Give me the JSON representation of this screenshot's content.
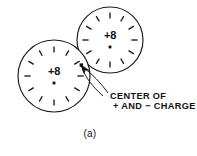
{
  "figure": {
    "caption": "(a)",
    "background_color": "#ffffff",
    "ink_color": "#111111",
    "width": 197,
    "height": 156
  },
  "callout": {
    "line1": "CENTER OF",
    "line2": "+ AND − CHARGE",
    "arrow_target_x": 82,
    "arrow_target_y": 66
  },
  "atoms": [
    {
      "id": "upper-right-atom",
      "nucleus_label": "+8",
      "center_x": 110,
      "center_y": 40,
      "radius": 33,
      "electron_count": 12,
      "electron_symbol": "−",
      "electron_ring_radius": 24.5,
      "nucleus_dot_offset_y": 7,
      "label_offset_y": -1
    },
    {
      "id": "lower-left-atom",
      "nucleus_label": "+8",
      "center_x": 54,
      "center_y": 76,
      "radius": 36,
      "electron_count": 12,
      "electron_symbol": "−",
      "electron_ring_radius": 26.5,
      "nucleus_dot_offset_y": 7,
      "label_offset_y": -1
    }
  ]
}
